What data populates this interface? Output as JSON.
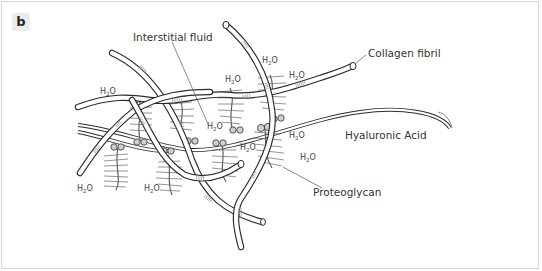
{
  "panel": {
    "label": "b"
  },
  "diagram": {
    "labels": {
      "interstitial_fluid": "Interstitial fluid",
      "collagen_fibril": "Collagen fibril",
      "hyaluronic_acid": "Hyaluronic Acid",
      "proteoglycan": "Proteoglycan"
    },
    "water": {
      "main": "H",
      "sub": "2",
      "tail": "O"
    },
    "water_positions_count": 10,
    "colors": {
      "stroke": "#2b2b2b",
      "bead_fill": "#cfcfcf",
      "background": "#ffffff",
      "border": "#d6d6d6",
      "label_bg": "#ececec"
    }
  }
}
